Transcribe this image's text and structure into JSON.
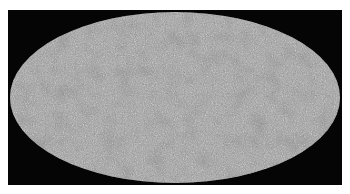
{
  "image": {
    "description": "All-sky map in Mollweide projection showing a grey speckled noise field on a black background",
    "projection": "mollweide",
    "colors": {
      "background": "#050505",
      "map_base": "#9a9a9a",
      "speckle_dark": "#4a4a4a",
      "speckle_light": "#c4c4c4"
    }
  }
}
